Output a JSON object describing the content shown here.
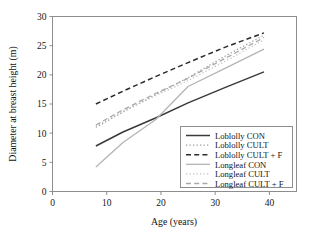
{
  "figure": {
    "background": "#ffffff",
    "frame_color": "#8a8a8a"
  },
  "chart_data": {
    "type": "line",
    "title": "",
    "xlabel": "Age (years)",
    "ylabel": "Diameter at breast height (m)",
    "xlim": [
      0,
      45
    ],
    "ylim": [
      0,
      30
    ],
    "xticks": [
      0,
      10,
      20,
      30,
      40
    ],
    "yticks": [
      0,
      5,
      10,
      15,
      20,
      25,
      30
    ],
    "grid": false,
    "legend_position": "lower right",
    "series": [
      {
        "name": "Loblolly CON",
        "style": "solid",
        "color": "#3a3a3a",
        "width": 1.5,
        "x": [
          8,
          13,
          19,
          25,
          32,
          39
        ],
        "y": [
          7.8,
          10.2,
          12.6,
          15.2,
          17.9,
          20.5
        ]
      },
      {
        "name": "Loblolly CULT",
        "style": "dotted",
        "color": "#9a9a9a",
        "width": 1.2,
        "x": [
          8,
          13,
          19,
          25,
          32,
          39
        ],
        "y": [
          11.0,
          13.6,
          16.6,
          19.5,
          23.3,
          26.8
        ]
      },
      {
        "name": "Loblolly CULT + F",
        "style": "dashed",
        "color": "#2b2b2b",
        "width": 1.5,
        "x": [
          8,
          13,
          19,
          25,
          32,
          39
        ],
        "y": [
          15.0,
          17.2,
          19.7,
          22.1,
          24.8,
          27.2
        ]
      },
      {
        "name": "Longleaf CON",
        "style": "solid",
        "color": "#b4b4b4",
        "width": 1.3,
        "x": [
          8,
          13,
          19,
          25,
          32,
          39
        ],
        "y": [
          4.2,
          8.4,
          12.3,
          18.0,
          21.2,
          24.4
        ]
      },
      {
        "name": "Longleaf CULT",
        "style": "dotted",
        "color": "#c2c2c2",
        "width": 1.2,
        "x": [
          8,
          13,
          19,
          25,
          32,
          39
        ],
        "y": [
          11.2,
          13.8,
          16.4,
          19.0,
          22.4,
          26.0
        ]
      },
      {
        "name": "Longleaf CULT + F",
        "style": "dashed",
        "color": "#a8a8a8",
        "width": 1.3,
        "x": [
          8,
          13,
          19,
          25,
          32,
          39
        ],
        "y": [
          11.4,
          14.0,
          16.8,
          19.4,
          22.9,
          26.4
        ]
      }
    ]
  },
  "axis": {
    "x_tick_labels": [
      "0",
      "10",
      "20",
      "30",
      "40"
    ],
    "y_tick_labels": [
      "0",
      "5",
      "10",
      "15",
      "20",
      "25",
      "30"
    ],
    "x_title": "Age (years)",
    "y_title": "Diameter at breast height (m)"
  },
  "legend": {
    "entries": [
      {
        "label": "Loblolly CON"
      },
      {
        "label": "Loblolly CULT"
      },
      {
        "label": "Loblolly CULT + F"
      },
      {
        "label": "Longleaf CON"
      },
      {
        "label": "Longleaf CULT"
      },
      {
        "label": "Longleaf CULT + F"
      }
    ]
  }
}
